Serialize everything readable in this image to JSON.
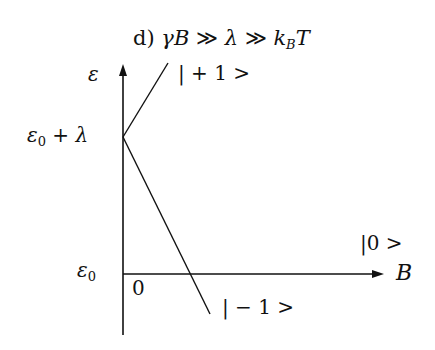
{
  "diagram": {
    "title": {
      "prefix": "d)",
      "condition_part1": "γB",
      "op1": "≫",
      "lambda": "λ",
      "op2": "≫",
      "kB": "k",
      "kB_sub": "B",
      "T": "T"
    },
    "y_axis": {
      "label": "ε"
    },
    "x_axis": {
      "label": "B"
    },
    "tick_labels": {
      "eps0_plus_lambda_eps": "ε",
      "eps0_plus_lambda_sub": "0",
      "eps0_plus_lambda_rest": " + λ",
      "eps0_eps": "ε",
      "eps0_sub": "0",
      "origin": "0"
    },
    "states": {
      "plus_one": "| + 1 >",
      "zero": "|0 >",
      "minus_one": "| − 1 >"
    },
    "colors": {
      "ink": "#111111",
      "background": "#ffffff"
    }
  }
}
